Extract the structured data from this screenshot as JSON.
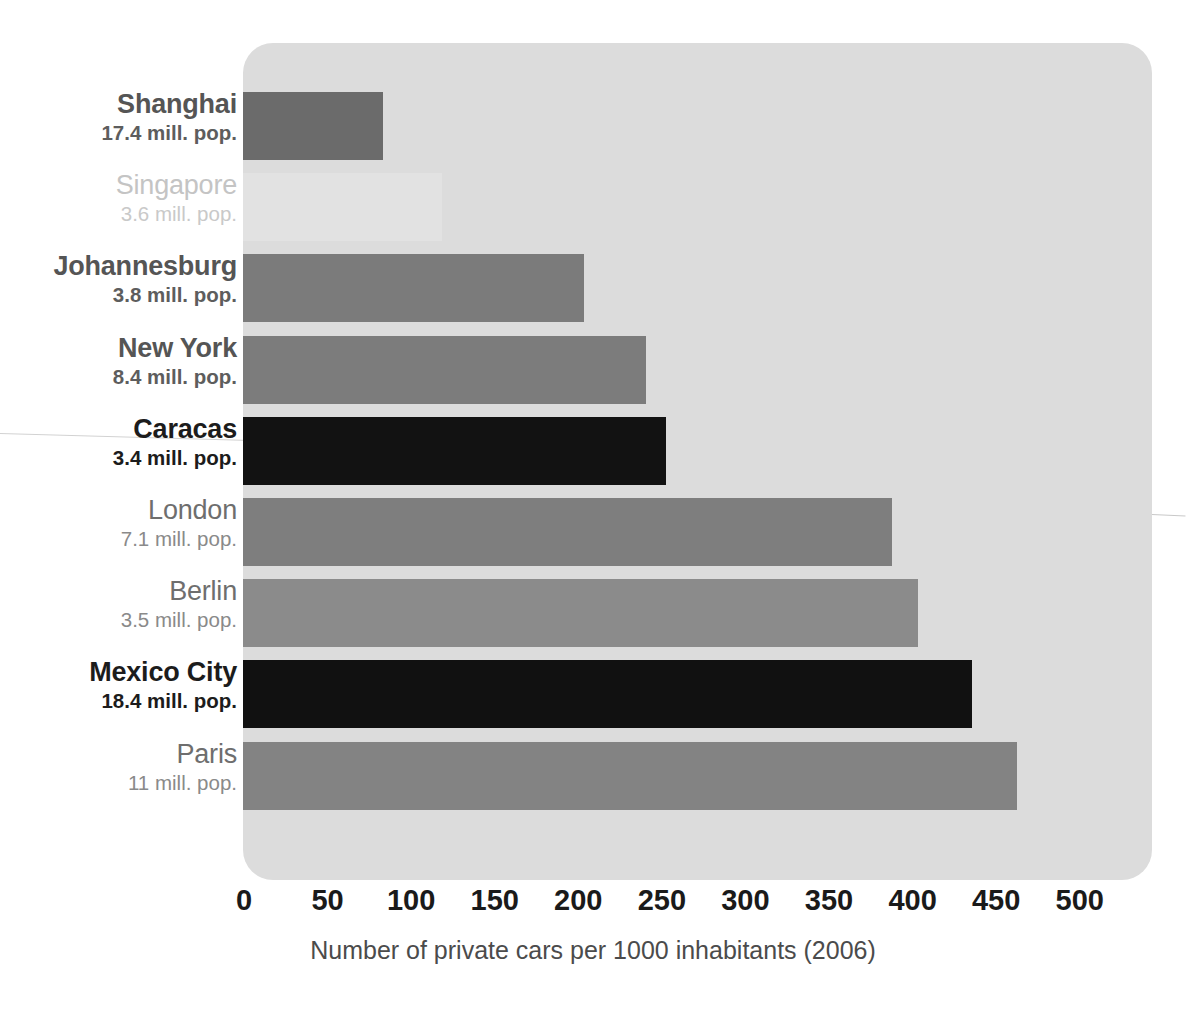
{
  "chart_data": {
    "type": "bar",
    "orientation": "horizontal",
    "title": "",
    "xlabel": "Number of private cars per 1000 inhabitants (2006)",
    "ylabel": "",
    "xlim": [
      0,
      500
    ],
    "xticks": [
      0,
      50,
      100,
      150,
      200,
      250,
      300,
      350,
      400,
      450,
      500
    ],
    "xtick_labels": [
      "0",
      "50",
      "100",
      "150",
      "200",
      "250",
      "300",
      "350",
      "400",
      "450",
      "500"
    ],
    "grid": false,
    "legend": null,
    "categories": [
      "Shanghai",
      "Singapore",
      "Johannesburg",
      "New York",
      "Caracas",
      "London",
      "Berlin",
      "Mexico City",
      "Paris"
    ],
    "values": [
      84,
      119,
      204,
      241,
      253,
      388,
      404,
      436,
      463
    ],
    "bars": [
      {
        "city": "Shanghai",
        "population_label": "17.4 mill. pop.",
        "value": 84,
        "color": "#6b6b6b",
        "emphasis": "semi"
      },
      {
        "city": "Singapore",
        "population_label": "3.6 mill. pop.",
        "value": 119,
        "color": "#e2e2e2",
        "emphasis": "dim"
      },
      {
        "city": "Johannesburg",
        "population_label": "3.8 mill. pop.",
        "value": 204,
        "color": "#7b7b7b",
        "emphasis": "semi"
      },
      {
        "city": "New York",
        "population_label": "8.4  mill. pop.",
        "value": 241,
        "color": "#7c7c7c",
        "emphasis": "semi"
      },
      {
        "city": "Caracas",
        "population_label": "3.4 mill. pop.",
        "value": 253,
        "color": "#121212",
        "emphasis": "strong"
      },
      {
        "city": "London",
        "population_label": "7.1 mill. pop.",
        "value": 388,
        "color": "#7e7e7e",
        "emphasis": "muted"
      },
      {
        "city": "Berlin",
        "population_label": "3.5  mill. pop.",
        "value": 404,
        "color": "#8b8b8b",
        "emphasis": "muted"
      },
      {
        "city": "Mexico City",
        "population_label": "18.4 mill. pop.",
        "value": 436,
        "color": "#111111",
        "emphasis": "strong"
      },
      {
        "city": "Paris",
        "population_label": "11 mill. pop.",
        "value": 463,
        "color": "#838383",
        "emphasis": "muted"
      }
    ],
    "colors": {
      "panel_background": "#dcdcdc",
      "page_background": "#ffffff",
      "highlight_bar": "#111111",
      "standard_bar": "#808080",
      "faded_bar": "#e2e2e2",
      "tick_text": "#1a1a1a",
      "axis_title_text": "#4b4b4b"
    }
  }
}
